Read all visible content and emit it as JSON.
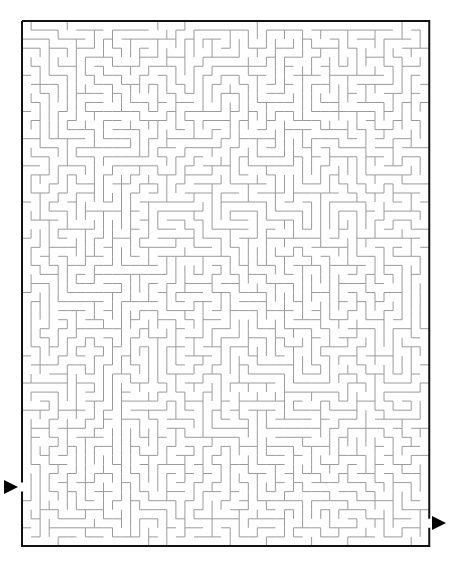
{
  "puzzle": {
    "type": "maze",
    "cols": 45,
    "rows": 58,
    "origin_x": 22,
    "origin_y": 21,
    "cell_size": 9.05,
    "wall_color": "#9a9a9a",
    "border_color": "#111111",
    "seed": 1337,
    "entry": {
      "side": "left",
      "row": 51,
      "label": "start-arrow"
    },
    "exit": {
      "side": "right",
      "row": 55,
      "label": "finish-arrow"
    }
  }
}
